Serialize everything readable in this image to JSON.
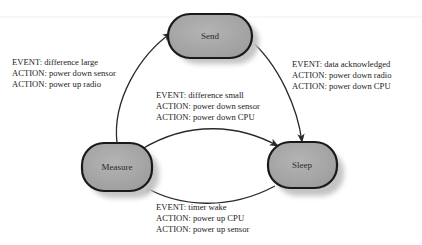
{
  "diagram": {
    "states": {
      "send": {
        "label": "Send"
      },
      "measure": {
        "label": "Measure"
      },
      "sleep": {
        "label": "Sleep"
      }
    },
    "transitions": [
      {
        "from": "Measure",
        "to": "Send",
        "lines": [
          "EVENT: difference large",
          "ACTION: power down sensor",
          "ACTION: power up radio"
        ]
      },
      {
        "from": "Send",
        "to": "Sleep",
        "lines": [
          "EVENT: data acknowledged",
          "ACTION: power down radio",
          "ACTION: power down CPU"
        ]
      },
      {
        "from": "Measure",
        "to": "Sleep",
        "lines": [
          "EVENT: difference small",
          "ACTION: power down sensor",
          "ACTION: power down CPU"
        ]
      },
      {
        "from": "Sleep",
        "to": "Measure",
        "lines": [
          "EVENT: timer wake",
          "ACTION: power up CPU",
          "ACTION: power up sensor"
        ]
      }
    ],
    "colors": {
      "node_fill": "#a9a9a9",
      "node_stroke": "#1a1a1a",
      "shadow": "#c8c8c8",
      "edge": "#2a2a2a"
    }
  }
}
